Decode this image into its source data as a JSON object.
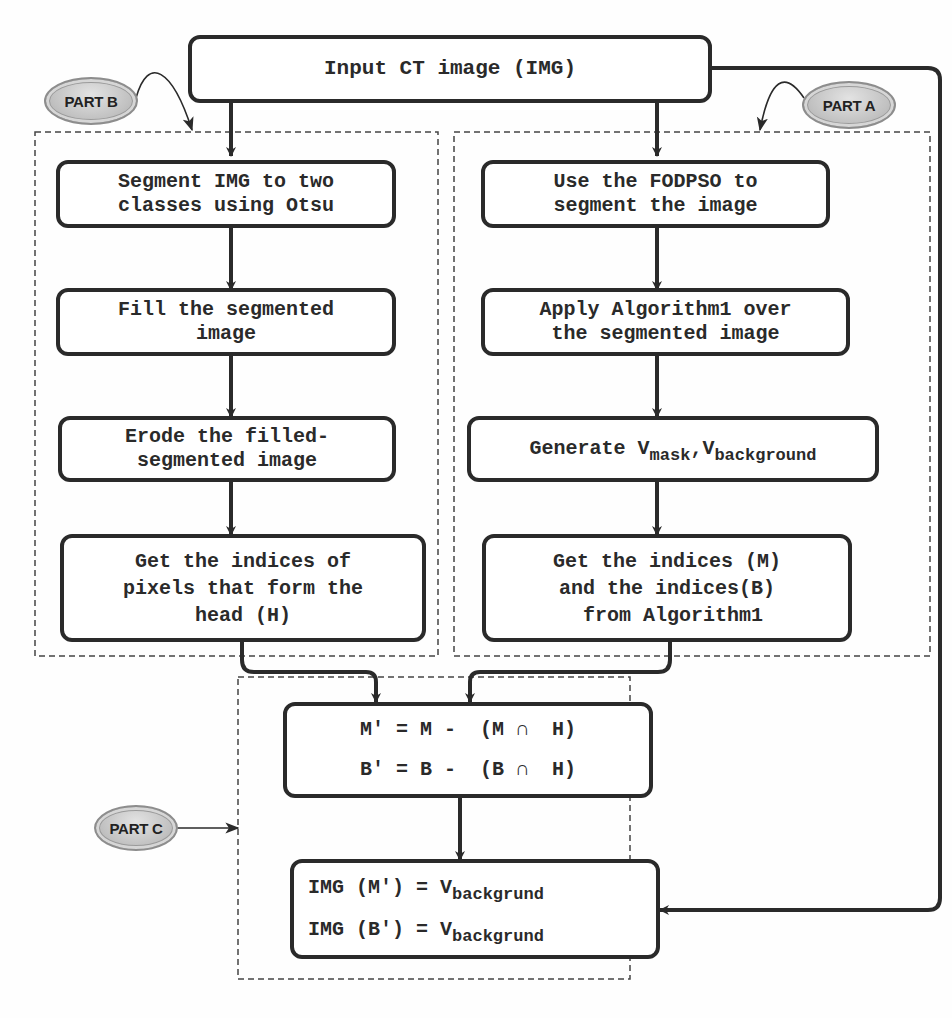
{
  "diagram": {
    "input_node": {
      "label": "Input CT image (IMG)"
    },
    "part_labels": {
      "a": "PART A",
      "b": "PART B",
      "c": "PART C"
    },
    "part_b": {
      "steps": [
        {
          "lines": [
            "Segment IMG to two",
            "classes using Otsu"
          ]
        },
        {
          "lines": [
            "Fill the segmented",
            "image"
          ]
        },
        {
          "lines": [
            "Erode the filled-",
            "segmented image"
          ]
        },
        {
          "lines": [
            "Get the indices of",
            "pixels that form the",
            "head (H)"
          ]
        }
      ]
    },
    "part_a": {
      "steps": [
        {
          "lines": [
            "Use the FODPSO to",
            "segment the image"
          ]
        },
        {
          "lines": [
            "Apply Algorithm1 over",
            "the segmented image"
          ]
        },
        {
          "prefix": "Generate V",
          "sub1": "mask",
          "mid": ",V",
          "sub2": "background"
        },
        {
          "lines": [
            "Get the indices (M)",
            "and the indices(B)",
            " from Algorithm1"
          ]
        }
      ]
    },
    "part_c": {
      "set_ops": {
        "line1": "M' = M -  (M ∩  H)",
        "line2": "B' = B -  (B ∩  H)"
      },
      "assign": {
        "line1_prefix": "IMG (M') = V",
        "line1_sub": "backgrund",
        "line2_prefix": "IMG (B') = V",
        "line2_sub": "backgrund"
      }
    },
    "colors": {
      "stroke": "#2a2a2a",
      "dashed": "#444444",
      "badge_fill": "#c2c2c2"
    }
  }
}
